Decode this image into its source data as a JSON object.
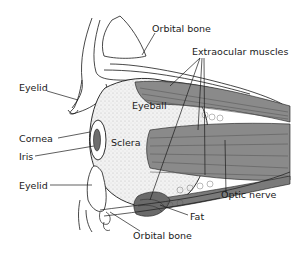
{
  "diagram": {
    "labels": {
      "orbital_bone_top": "Orbital bone",
      "extraocular_muscles": "Extraocular muscles",
      "eyelid_upper": "Eyelid",
      "eyeball": "Eyeball",
      "cornea": "Cornea",
      "sclera": "Sclera",
      "iris": "Iris",
      "eyelid_lower": "Eyelid",
      "optic_nerve": "Optic nerve",
      "fat": "Fat",
      "orbital_bone_bottom": "Orbital bone"
    },
    "colors": {
      "line": "#1a1a1a",
      "muscle": "#8a8a8a",
      "muscle_dark": "#5a5a5a",
      "stipple": "#d8d8d8",
      "background": "#ffffff"
    }
  }
}
